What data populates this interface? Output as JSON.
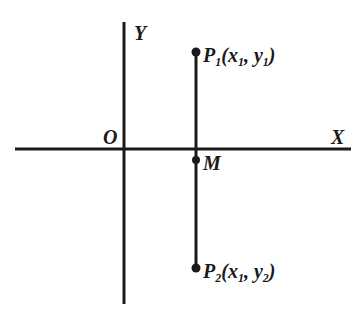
{
  "diagram": {
    "axes": {
      "x_label": "X",
      "y_label": "Y",
      "origin_label": "O"
    },
    "points": [
      {
        "name": "P1",
        "base": "P",
        "sub": "1",
        "coords": {
          "x": "x",
          "x_sub": "1",
          "y": "y",
          "y_sub": "1"
        }
      },
      {
        "name": "M",
        "base": "M"
      },
      {
        "name": "P2",
        "base": "P",
        "sub": "2",
        "coords": {
          "x": "x",
          "x_sub": "1",
          "y": "y",
          "y_sub": "2"
        }
      }
    ],
    "segment": "P1P2 vertical segment with midpoint M on the X axis",
    "colors": {
      "line": "#1a1a1a",
      "background": "#ffffff"
    }
  }
}
